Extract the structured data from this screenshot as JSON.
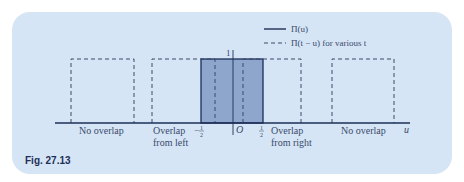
{
  "figure": {
    "caption": "Fig. 27.13",
    "legend": {
      "solid_label": "Π(u)",
      "dashed_label": "Π(t − u) for various t"
    },
    "labels": {
      "height_one": "1",
      "neg_half_minus": "−",
      "half_num": "1",
      "half_den": "2",
      "origin": "O",
      "axis_var": "u"
    },
    "regions": [
      {
        "line1": "No overlap",
        "line2": ""
      },
      {
        "line1": "Overlap",
        "line2": "from left"
      },
      {
        "line1": "Overlap",
        "line2": "from right"
      },
      {
        "line1": "No overlap",
        "line2": ""
      }
    ],
    "colors": {
      "card_background": "#d5e5f5",
      "box_fill": "#8ea5cc",
      "line": "#1d2f57",
      "text": "#3a4a6b"
    }
  }
}
